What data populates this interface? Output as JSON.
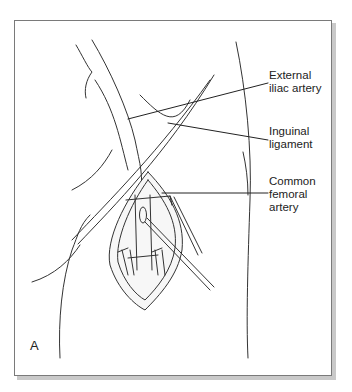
{
  "figure": {
    "panel_letter": "A",
    "labels": [
      {
        "id": "external-iliac-artery",
        "line1": "External",
        "line2": "iliac artery"
      },
      {
        "id": "inguinal-ligament",
        "line1": "Inguinal",
        "line2": "ligament"
      },
      {
        "id": "common-femoral-artery",
        "line1": "Common",
        "line2": "femoral",
        "line3": "artery"
      }
    ]
  }
}
